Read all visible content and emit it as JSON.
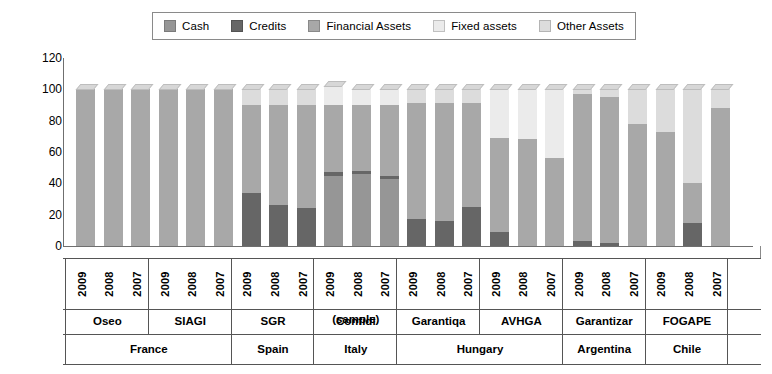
{
  "legend": {
    "items": [
      {
        "label": "Cash",
        "color": "#969696",
        "key": "cash"
      },
      {
        "label": "Credits",
        "color": "#666666",
        "key": "credits"
      },
      {
        "label": "Financial Assets",
        "color": "#a8a8a8",
        "key": "financial_assets"
      },
      {
        "label": "Fixed assets",
        "color": "#ebebeb",
        "key": "fixed_assets"
      },
      {
        "label": "Other Assets",
        "color": "#dcdcdc",
        "key": "other_assets"
      }
    ]
  },
  "axis": {
    "y_ticks": [
      "120",
      "100",
      "80",
      "60",
      "40",
      "20",
      "0"
    ],
    "y_min": 0,
    "y_max": 120
  },
  "groups": [
    {
      "country": "France",
      "institutions": [
        {
          "name": "Oseo",
          "name_line2": "",
          "years": [
            "2009",
            "2008",
            "2007"
          ]
        },
        {
          "name": "SIAGI",
          "name_line2": "",
          "years": [
            "2009",
            "2008",
            "2007"
          ]
        }
      ]
    },
    {
      "country": "Spain",
      "institutions": [
        {
          "name": "SGR",
          "name_line2": "",
          "years": [
            "2009",
            "2008",
            "2007"
          ]
        }
      ]
    },
    {
      "country": "Italy",
      "institutions": [
        {
          "name": "Confidi",
          "name_line2": "(sample)",
          "years": [
            "2009",
            "2008",
            "2007"
          ]
        }
      ]
    },
    {
      "country": "Hungary",
      "institutions": [
        {
          "name": "Garantiqa",
          "name_line2": "",
          "years": [
            "2009",
            "2008",
            "2007"
          ]
        },
        {
          "name": "AVHGA",
          "name_line2": "",
          "years": [
            "2009",
            "2008",
            "2007"
          ]
        }
      ]
    },
    {
      "country": "Argentina",
      "institutions": [
        {
          "name": "Garantizar",
          "name_line2": "",
          "years": [
            "2009",
            "2008",
            "2007"
          ]
        }
      ]
    },
    {
      "country": "Chile",
      "institutions": [
        {
          "name": "FOGAPE",
          "name_line2": "",
          "years": [
            "2009",
            "2008",
            "2007"
          ]
        }
      ]
    }
  ],
  "chart_data": {
    "type": "bar",
    "subtype": "stacked-column-3d",
    "title": "",
    "xlabel": "",
    "ylabel": "",
    "ylim": [
      0,
      120
    ],
    "yticks": [
      0,
      20,
      40,
      60,
      80,
      100,
      120
    ],
    "grid": false,
    "legend_position": "top",
    "categories": [
      "Oseo 2009",
      "Oseo 2008",
      "Oseo 2007",
      "SIAGI 2009",
      "SIAGI 2008",
      "SIAGI 2007",
      "SGR 2009",
      "SGR 2008",
      "SGR 2007",
      "Confidi (sample) 2009",
      "Confidi (sample) 2008",
      "Confidi (sample) 2007",
      "Garantiqa 2009",
      "Garantiqa 2008",
      "Garantiqa 2007",
      "AVHGA 2009",
      "AVHGA 2008",
      "AVHGA 2007",
      "Garantizar 2009",
      "Garantizar 2008",
      "Garantizar 2007",
      "FOGAPE 2009",
      "FOGAPE 2008",
      "FOGAPE 2007"
    ],
    "series": [
      {
        "name": "Cash",
        "color": "#969696",
        "values": [
          0,
          0,
          0,
          0,
          0,
          0,
          0,
          0,
          0,
          45,
          46,
          43,
          0,
          0,
          0,
          0,
          0,
          0,
          0,
          0,
          0,
          0,
          0,
          0
        ]
      },
      {
        "name": "Credits",
        "color": "#666666",
        "values": [
          0,
          0,
          0,
          0,
          0,
          0,
          34,
          26,
          24,
          2,
          2,
          2,
          17,
          16,
          25,
          9,
          0,
          0,
          3,
          2,
          0,
          0,
          15,
          0
        ]
      },
      {
        "name": "Financial Assets",
        "color": "#a8a8a8",
        "values": [
          100,
          100,
          100,
          100,
          100,
          100,
          56,
          64,
          66,
          43,
          42,
          45,
          74,
          75,
          66,
          60,
          68,
          56,
          94,
          93,
          78,
          73,
          25,
          88
        ]
      },
      {
        "name": "Fixed assets",
        "color": "#ebebeb",
        "values": [
          0,
          0,
          0,
          0,
          0,
          0,
          0,
          0,
          0,
          12,
          10,
          10,
          0,
          0,
          0,
          31,
          32,
          44,
          0,
          0,
          0,
          0,
          0,
          0
        ]
      },
      {
        "name": "Other Assets",
        "color": "#dcdcdc",
        "values": [
          0,
          0,
          0,
          0,
          0,
          0,
          10,
          10,
          10,
          0,
          0,
          0,
          9,
          9,
          9,
          0,
          0,
          0,
          3,
          5,
          22,
          27,
          60,
          12
        ]
      }
    ]
  }
}
